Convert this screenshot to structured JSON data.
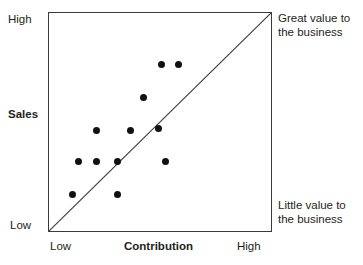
{
  "axes": {
    "y_title": "Sales",
    "y_high": "High",
    "y_low": "Low",
    "x_title": "Contribution",
    "x_low": "Low",
    "x_high": "High"
  },
  "annotations": {
    "top_right": "Great value to\nthe business",
    "top_right_line1": "Great value to",
    "top_right_line2": "the business",
    "bottom_right_line1": "Little value to",
    "bottom_right_line2": "the business"
  },
  "colors": {
    "point": "#111111",
    "frame": "#3a3a3a",
    "diagonal": "#3a3a3a",
    "text": "#231f20",
    "background": "#ffffff"
  },
  "chart_data": {
    "type": "scatter",
    "title": "",
    "xlabel": "Contribution",
    "ylabel": "Sales",
    "xlim": [
      0,
      100
    ],
    "ylim": [
      0,
      100
    ],
    "xtick_labels": [
      "Low",
      "High"
    ],
    "ytick_labels": [
      "Low",
      "High"
    ],
    "grid": false,
    "legend": "none",
    "reference_line": {
      "name": "diagonal-parity-line",
      "from": [
        0,
        0
      ],
      "to": [
        100,
        100
      ]
    },
    "points": [
      {
        "x": 50.4,
        "y": 76.4
      },
      {
        "x": 57.6,
        "y": 76.4
      },
      {
        "x": 42.4,
        "y": 61.8
      },
      {
        "x": 21.4,
        "y": 46.8
      },
      {
        "x": 36.2,
        "y": 46.8
      },
      {
        "x": 49.1,
        "y": 47.3
      },
      {
        "x": 13.0,
        "y": 32.3
      },
      {
        "x": 21.0,
        "y": 32.3
      },
      {
        "x": 30.8,
        "y": 32.7
      },
      {
        "x": 52.2,
        "y": 32.7
      },
      {
        "x": 10.7,
        "y": 17.3
      },
      {
        "x": 30.8,
        "y": 17.3
      }
    ],
    "n_points": 12,
    "annotations": [
      {
        "position": "top-right-outside",
        "text": "Great value to the business"
      },
      {
        "position": "bottom-right-outside",
        "text": "Little value to the business"
      }
    ]
  }
}
